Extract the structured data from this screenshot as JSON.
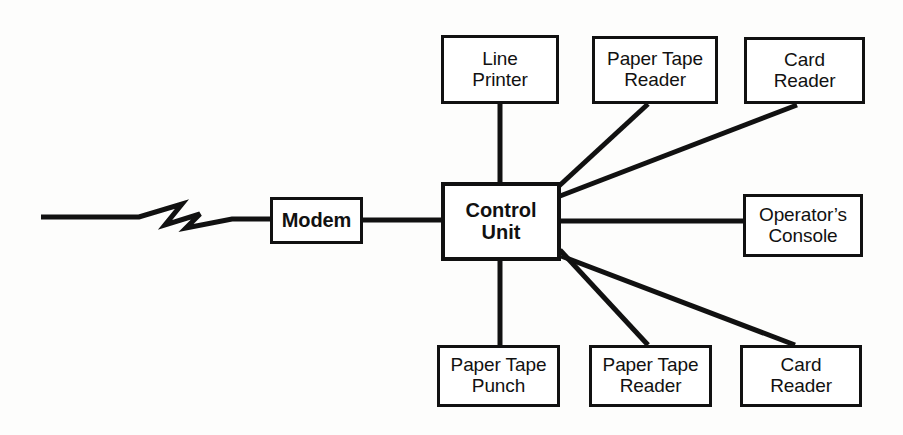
{
  "diagram": {
    "type": "block-diagram",
    "background_color": "#fdfdfc",
    "line_color": "#111111",
    "canvas": {
      "width": 903,
      "height": 435
    },
    "nodes": [
      {
        "id": "line-printer",
        "label": "Line\nPrinter",
        "x": 441,
        "y": 35,
        "w": 118,
        "h": 69,
        "emphasis": false
      },
      {
        "id": "paper-tape-reader-top",
        "label": "Paper Tape\nReader",
        "x": 592,
        "y": 36,
        "w": 126,
        "h": 68,
        "emphasis": false
      },
      {
        "id": "card-reader-top",
        "label": "Card\nReader",
        "x": 744,
        "y": 37,
        "w": 121,
        "h": 67,
        "emphasis": false
      },
      {
        "id": "modem",
        "label": "Modem",
        "x": 270,
        "y": 197,
        "w": 93,
        "h": 47,
        "emphasis": false
      },
      {
        "id": "control-unit",
        "label": "Control\nUnit",
        "x": 441,
        "y": 182,
        "w": 120,
        "h": 79,
        "emphasis": true
      },
      {
        "id": "operators-console",
        "label": "Operator’s\nConsole",
        "x": 743,
        "y": 194,
        "w": 120,
        "h": 63,
        "emphasis": false
      },
      {
        "id": "paper-tape-punch",
        "label": "Paper Tape\nPunch",
        "x": 437,
        "y": 345,
        "w": 123,
        "h": 62,
        "emphasis": false
      },
      {
        "id": "paper-tape-reader-bottom",
        "label": "Paper Tape\nReader",
        "x": 589,
        "y": 345,
        "w": 123,
        "h": 62,
        "emphasis": false
      },
      {
        "id": "card-reader-bottom",
        "label": "Card\nReader",
        "x": 740,
        "y": 345,
        "w": 122,
        "h": 62,
        "emphasis": false
      }
    ],
    "connections": [
      {
        "id": "link-telephone-line",
        "from": "external-line",
        "to": "modem",
        "style": "lightning-bolt"
      },
      {
        "id": "link-modem-control",
        "from": "modem",
        "to": "control-unit",
        "style": "straight"
      },
      {
        "id": "link-control-line-printer",
        "from": "control-unit",
        "to": "line-printer",
        "style": "straight"
      },
      {
        "id": "link-control-paper-tape-reader-top",
        "from": "control-unit",
        "to": "paper-tape-reader-top",
        "style": "diagonal"
      },
      {
        "id": "link-control-card-reader-top",
        "from": "control-unit",
        "to": "card-reader-top",
        "style": "diagonal"
      },
      {
        "id": "link-control-operators-console",
        "from": "control-unit",
        "to": "operators-console",
        "style": "straight"
      },
      {
        "id": "link-control-paper-tape-punch",
        "from": "control-unit",
        "to": "paper-tape-punch",
        "style": "straight"
      },
      {
        "id": "link-control-paper-tape-reader-bottom",
        "from": "control-unit",
        "to": "paper-tape-reader-bottom",
        "style": "diagonal"
      },
      {
        "id": "link-control-card-reader-bottom",
        "from": "control-unit",
        "to": "card-reader-bottom",
        "style": "diagonal"
      }
    ]
  }
}
